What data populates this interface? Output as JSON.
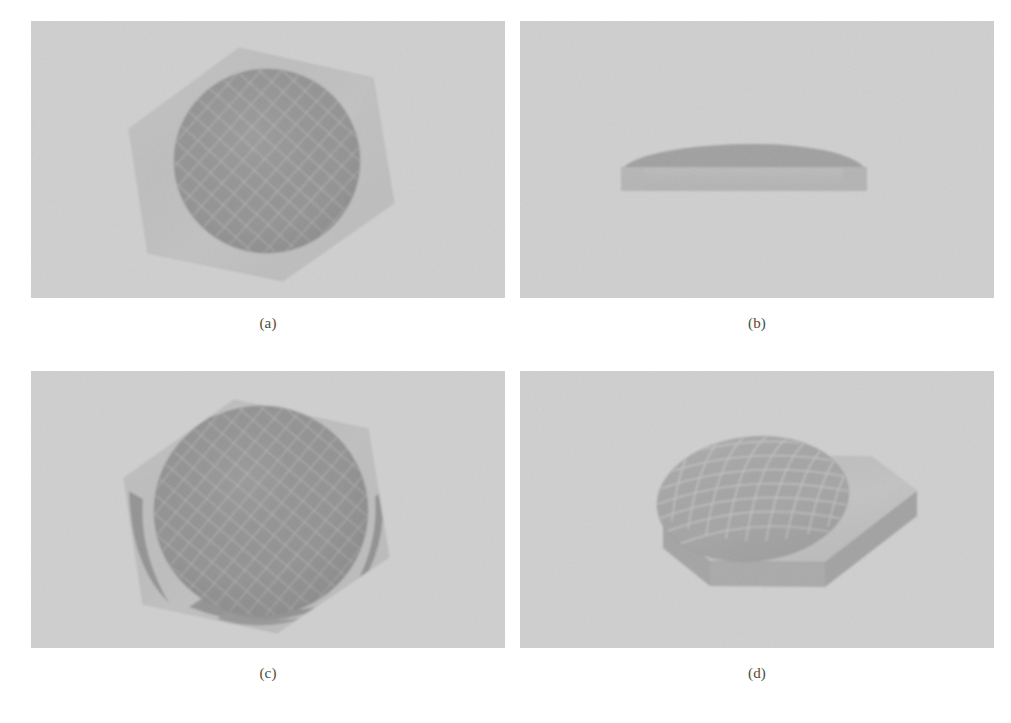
{
  "figure": {
    "background_color": "#ffffff",
    "panel_background_color": "#e9e9e9",
    "panels": [
      {
        "id": "a",
        "label": "(a)",
        "view": "top view",
        "shapes": [
          "hexagon-plate",
          "mesh-disc"
        ],
        "hex_fill": "#cdcdcd",
        "disc_fill": "#6d6d6d",
        "mesh_line_color": "#b4b4b4"
      },
      {
        "id": "b",
        "label": "(b)",
        "view": "side view",
        "shapes": [
          "slab",
          "dome"
        ],
        "slab_fill": "#b9b9b9",
        "dome_fill": "#9d9d9d"
      },
      {
        "id": "c",
        "label": "(c)",
        "view": "top view with oversized dome",
        "shapes": [
          "hexagon-plate",
          "mesh-dome",
          "corner-wedges"
        ],
        "hex_fill": "#c9c9c9",
        "disc_fill": "#6a6a6a",
        "mesh_line_color": "#b2b2b2"
      },
      {
        "id": "d",
        "label": "(d)",
        "view": "perspective view",
        "shapes": [
          "hexagon-plate-3d",
          "mesh-dome"
        ],
        "hex_top_fill": "#cfcfcf",
        "hex_side_fill": "#8e8e8e",
        "disc_fill": "#929292",
        "mesh_line_color": "#d2d2d2"
      }
    ]
  }
}
